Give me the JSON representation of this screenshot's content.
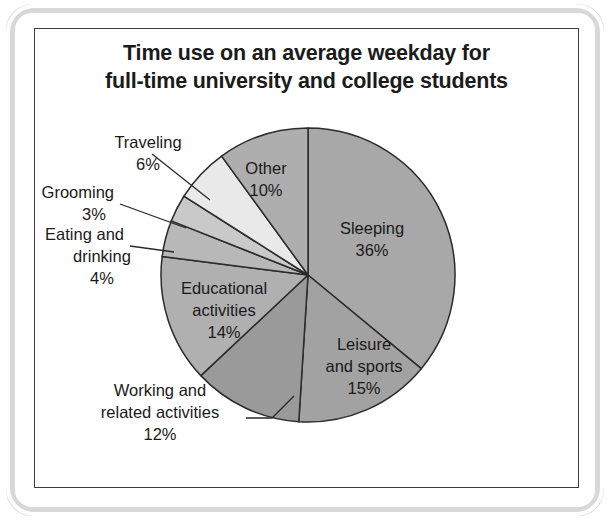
{
  "chart_data": {
    "type": "pie",
    "title": "Time use on an average weekday for full-time university and college students",
    "title_lines": [
      "Time use on an average weekday for",
      "full-time university and college students"
    ],
    "categories": [
      "Sleeping",
      "Leisure and sports",
      "Working and related activities",
      "Educational activities",
      "Eating and drinking",
      "Grooming",
      "Traveling",
      "Other"
    ],
    "values": [
      36,
      15,
      12,
      14,
      4,
      3,
      6,
      10
    ],
    "value_unit": "%",
    "xlabel": "",
    "ylabel": "",
    "legend": "none",
    "grid": false,
    "start_angle_deg": 0,
    "direction": "clockwise",
    "slices": [
      {
        "name": "Sleeping",
        "value": 36,
        "value_label": "36%",
        "label_lines": [
          "Sleeping",
          "36%"
        ],
        "color": "#a8a8a8",
        "label_placement": "inside",
        "has_leader": false
      },
      {
        "name": "Leisure and sports",
        "value": 15,
        "value_label": "15%",
        "label_lines": [
          "Leisure",
          "and sports",
          "15%"
        ],
        "color": "#a2a2a2",
        "label_placement": "inside",
        "has_leader": false
      },
      {
        "name": "Working and related activities",
        "value": 12,
        "value_label": "12%",
        "label_lines": [
          "Working and",
          "related activities",
          "12%"
        ],
        "color": "#9a9a9a",
        "label_placement": "outside",
        "has_leader": true
      },
      {
        "name": "Educational activities",
        "value": 14,
        "value_label": "14%",
        "label_lines": [
          "Educational",
          "activities",
          "14%"
        ],
        "color": "#b0b0b0",
        "label_placement": "inside",
        "has_leader": false
      },
      {
        "name": "Eating and drinking",
        "value": 4,
        "value_label": "4%",
        "label_lines": [
          "Eating and",
          "drinking",
          "4%"
        ],
        "color": "#b8b8b8",
        "label_placement": "outside",
        "has_leader": true
      },
      {
        "name": "Grooming",
        "value": 3,
        "value_label": "3%",
        "label_lines": [
          "Grooming",
          "3%"
        ],
        "color": "#c9c9c9",
        "label_placement": "outside",
        "has_leader": true
      },
      {
        "name": "Traveling",
        "value": 6,
        "value_label": "6%",
        "label_lines": [
          "Traveling",
          "6%"
        ],
        "color": "#e9e9e9",
        "label_placement": "outside",
        "has_leader": true
      },
      {
        "name": "Other",
        "value": 10,
        "value_label": "10%",
        "label_lines": [
          "Other",
          "10%"
        ],
        "color": "#aeaeae",
        "label_placement": "inside",
        "has_leader": false
      }
    ]
  },
  "labels": {
    "sleeping_name": "Sleeping",
    "sleeping_pct": "36%",
    "leisure_l1": "Leisure",
    "leisure_l2": "and sports",
    "leisure_pct": "15%",
    "working_l1": "Working and",
    "working_l2": "related activities",
    "working_pct": "12%",
    "educational_l1": "Educational",
    "educational_l2": "activities",
    "educational_pct": "14%",
    "eating_l1": "Eating and",
    "eating_l2": "drinking",
    "eating_pct": "4%",
    "grooming_name": "Grooming",
    "grooming_pct": "3%",
    "traveling_name": "Traveling",
    "traveling_pct": "6%",
    "other_name": "Other",
    "other_pct": "10%"
  },
  "colors": {
    "frame": "#3c3c3c",
    "scan_edge": "#d8d8d8",
    "text": "#1a1a1a",
    "slice_outline": "#2b2b2b",
    "background": "#ffffff"
  }
}
